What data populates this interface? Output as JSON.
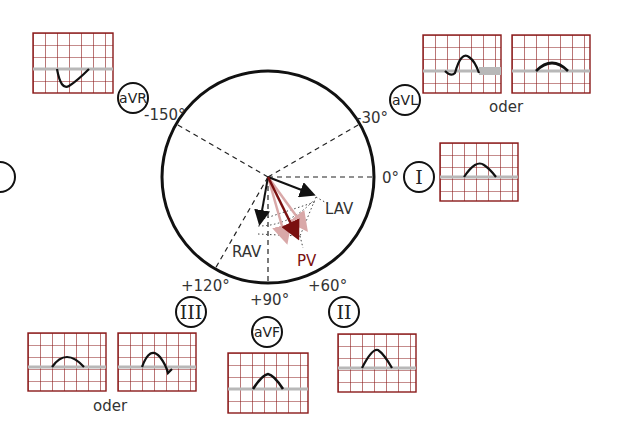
{
  "diagram": {
    "title": "",
    "angles": {
      "a_m150": "-150°",
      "a_m30": "-30°",
      "a_0": "0°",
      "a_p60": "+60°",
      "a_p90": "+90°",
      "a_p120": "+120°"
    },
    "leads": {
      "aVR": "aVR",
      "aVL": "aVL",
      "I": "I",
      "II": "II",
      "III": "III",
      "aVF": "aVF"
    },
    "vectors": {
      "lav": "LAV",
      "rav": "RAV",
      "pv": "PV"
    },
    "alternatives": {
      "top": "oder",
      "bottom": "oder"
    },
    "colors": {
      "grid": "#8b1a1a",
      "baseline": "#b8b8b8",
      "trace": "#111111",
      "pv": "#7a1010",
      "pv_faint": "#d9a8a8"
    }
  }
}
